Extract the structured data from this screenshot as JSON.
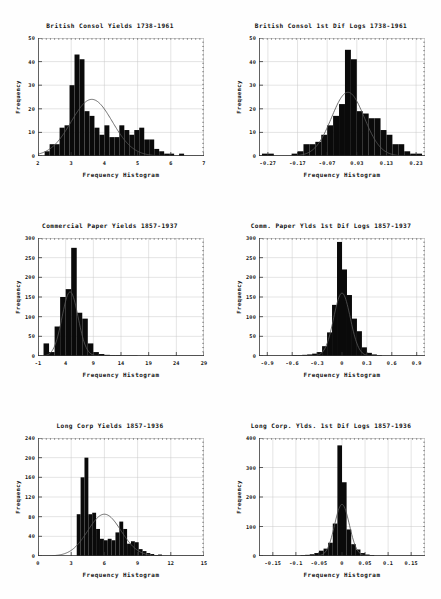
{
  "figure": {
    "name": "frequency-histogram-panel-grid",
    "rows": 3,
    "cols": 2,
    "bar_color": "#0a0a0a",
    "curve_color": "#555555",
    "grid_color": "#c9c9c9"
  },
  "chart_data": [
    {
      "id": "british-consol-yields",
      "type": "bar",
      "title": "British Consol Yields 1738-1961",
      "xlabel": "Frequency Histogram",
      "ylabel": "Frequency",
      "xlim": [
        2,
        7
      ],
      "ylim": [
        0,
        50
      ],
      "xticks": [
        2,
        3,
        4,
        5,
        6,
        7
      ],
      "xticklabels": [
        "2",
        "3",
        "4",
        "5",
        "6",
        "7"
      ],
      "yticks": [
        0,
        10,
        20,
        30,
        40,
        50
      ],
      "yticklabels": [
        "0",
        "10",
        "20",
        "30",
        "40",
        "50"
      ],
      "grid": true,
      "legend": "none",
      "bin_edges": [
        2.2,
        2.35,
        2.5,
        2.65,
        2.8,
        2.95,
        3.1,
        3.25,
        3.4,
        3.55,
        3.7,
        3.85,
        4.0,
        4.15,
        4.3,
        4.45,
        4.6,
        4.75,
        4.9,
        5.05,
        5.2,
        5.35,
        5.5,
        5.65,
        5.8,
        5.95,
        6.1,
        6.25,
        6.4
      ],
      "values": [
        2,
        5,
        5,
        12,
        13,
        30,
        43,
        41,
        19,
        17,
        12,
        9,
        13,
        8,
        8,
        13,
        11,
        9,
        11,
        12,
        7,
        7,
        3,
        2,
        1,
        1,
        0,
        1
      ],
      "curve": {
        "type": "normal-fit",
        "peak": 24,
        "mean": 3.62,
        "sd": 0.62
      }
    },
    {
      "id": "british-consol-1st-dif-logs",
      "type": "bar",
      "title": "British Consol 1st Dif Logs 1738-1961",
      "xlabel": "Frequency Histogram",
      "ylabel": "Frequency",
      "xlim": [
        -0.3,
        0.26
      ],
      "ylim": [
        0,
        50
      ],
      "xticks": [
        -0.27,
        -0.17,
        -0.07,
        0.03,
        0.13,
        0.23
      ],
      "xticklabels": [
        "-0.27",
        "-0.17",
        "-0.07",
        "0.03",
        "0.13",
        "0.23"
      ],
      "yticks": [
        0,
        10,
        20,
        30,
        40,
        50
      ],
      "yticklabels": [
        "0",
        "10",
        "20",
        "30",
        "40",
        "50"
      ],
      "grid": true,
      "legend": "none",
      "bin_edges": [
        -0.29,
        -0.27,
        -0.25,
        -0.23,
        -0.21,
        -0.19,
        -0.17,
        -0.15,
        -0.13,
        -0.11,
        -0.09,
        -0.07,
        -0.05,
        -0.03,
        -0.01,
        0.01,
        0.03,
        0.05,
        0.07,
        0.09,
        0.11,
        0.13,
        0.15,
        0.17,
        0.19,
        0.21,
        0.23,
        0.25
      ],
      "values": [
        1,
        1,
        0,
        0,
        0,
        1,
        2,
        5,
        5,
        6,
        9,
        13,
        17,
        22,
        45,
        41,
        19,
        18,
        16,
        16,
        11,
        9,
        5,
        5,
        2,
        1,
        1
      ],
      "curve": {
        "type": "normal-fit",
        "peak": 27,
        "mean": 0.0,
        "sd": 0.055
      }
    },
    {
      "id": "commercial-paper-yields",
      "type": "bar",
      "title": "Commercial Paper Yields 1857-1937",
      "xlabel": "Frequency Histogram",
      "ylabel": "Frequency",
      "xlim": [
        -1,
        29
      ],
      "ylim": [
        0,
        300
      ],
      "xticks": [
        -1,
        4,
        9,
        14,
        19,
        24,
        29
      ],
      "xticklabels": [
        "-1",
        "4",
        "9",
        "14",
        "19",
        "24",
        "29"
      ],
      "yticks": [
        0,
        50,
        100,
        150,
        200,
        250,
        300
      ],
      "yticklabels": [
        "0",
        "50",
        "100",
        "150",
        "200",
        "250",
        "300"
      ],
      "grid": true,
      "legend": "none",
      "bin_edges": [
        0,
        1,
        2,
        3,
        4,
        5,
        6,
        7,
        8,
        9,
        10,
        11,
        12,
        13,
        14,
        15,
        16,
        17,
        18,
        19,
        20
      ],
      "values": [
        32,
        10,
        75,
        150,
        170,
        275,
        110,
        95,
        32,
        10,
        5,
        3,
        2,
        2,
        1,
        1,
        1,
        0,
        0,
        0
      ],
      "curve": {
        "type": "normal-fit",
        "peak": 163,
        "mean": 4.8,
        "sd": 1.45
      }
    },
    {
      "id": "comm-paper-ylds-1st-dif-logs",
      "type": "bar",
      "title": "Comm. Paper Ylds 1st Dif Logs 1857-1937",
      "xlabel": "Frequency Histogram",
      "ylabel": "Frequency",
      "xlim": [
        -1.0,
        1.0
      ],
      "ylim": [
        0,
        300
      ],
      "xticks": [
        -0.9,
        -0.6,
        -0.3,
        0,
        0.3,
        0.6,
        0.9
      ],
      "xticklabels": [
        "-0.9",
        "-0.6",
        "-0.3",
        "0",
        "0.3",
        "0.6",
        "0.9"
      ],
      "yticks": [
        0,
        50,
        100,
        150,
        200,
        250,
        300
      ],
      "yticklabels": [
        "0",
        "50",
        "100",
        "150",
        "200",
        "250",
        "300"
      ],
      "grid": true,
      "legend": "none",
      "bin_edges": [
        -0.6,
        -0.54,
        -0.48,
        -0.42,
        -0.36,
        -0.3,
        -0.24,
        -0.18,
        -0.12,
        -0.06,
        0,
        0.06,
        0.12,
        0.18,
        0.24,
        0.3,
        0.36,
        0.42,
        0.48
      ],
      "values": [
        2,
        2,
        3,
        4,
        6,
        10,
        25,
        60,
        130,
        290,
        220,
        155,
        95,
        63,
        22,
        8,
        4,
        2
      ],
      "curve": {
        "type": "normal-fit",
        "peak": 160,
        "mean": 0.0,
        "sd": 0.1
      }
    },
    {
      "id": "long-corp-yields",
      "type": "bar",
      "title": "Long Corp Yields 1857-1936",
      "xlabel": "Frequency Histogram",
      "ylabel": "Frequency",
      "xlim": [
        0,
        15
      ],
      "ylim": [
        0,
        240
      ],
      "xticks": [
        0,
        3,
        6,
        9,
        12,
        15
      ],
      "xticklabels": [
        "0",
        "3",
        "6",
        "9",
        "12",
        "15"
      ],
      "yticks": [
        0,
        40,
        80,
        120,
        160,
        200,
        240
      ],
      "yticklabels": [
        "0",
        "40",
        "80",
        "120",
        "160",
        "200",
        "240"
      ],
      "grid": true,
      "legend": "none",
      "bin_edges": [
        3.5,
        3.85,
        4.2,
        4.55,
        4.9,
        5.25,
        5.6,
        5.95,
        6.3,
        6.65,
        7.0,
        7.35,
        7.7,
        8.05,
        8.4,
        8.75,
        9.1,
        9.45,
        9.8,
        10.15,
        10.5,
        10.85,
        11.2
      ],
      "values": [
        85,
        160,
        200,
        85,
        88,
        55,
        35,
        32,
        35,
        32,
        48,
        70,
        55,
        25,
        30,
        28,
        14,
        10,
        6,
        4,
        2,
        3
      ],
      "curve": {
        "type": "normal-fit",
        "peak": 85,
        "mean": 6.0,
        "sd": 1.5
      }
    },
    {
      "id": "long-corp-ylds-1st-dif-logs",
      "type": "bar",
      "title": "Long Corp. Ylds. 1st Dif Logs 1857-1936",
      "xlabel": "Frequency Histogram",
      "ylabel": "Frequency",
      "xlim": [
        -0.18,
        0.18
      ],
      "ylim": [
        0,
        400
      ],
      "xticks": [
        -0.15,
        -0.1,
        -0.05,
        0,
        0.05,
        0.1,
        0.15
      ],
      "xticklabels": [
        "-0.15",
        "-0.1",
        "-0.05",
        "0",
        "0.05",
        "0.1",
        "0.15"
      ],
      "yticks": [
        0,
        100,
        200,
        300,
        400
      ],
      "yticklabels": [
        "0",
        "100",
        "200",
        "300",
        "400"
      ],
      "grid": true,
      "legend": "none",
      "bin_edges": [
        -0.09,
        -0.08,
        -0.07,
        -0.06,
        -0.05,
        -0.04,
        -0.03,
        -0.02,
        -0.01,
        0,
        0.01,
        0.02,
        0.03,
        0.04,
        0.05,
        0.06,
        0.07
      ],
      "values": [
        3,
        4,
        6,
        10,
        18,
        25,
        45,
        110,
        375,
        250,
        90,
        40,
        22,
        10,
        5,
        3
      ],
      "curve": {
        "type": "normal-fit",
        "peak": 175,
        "mean": 0.0,
        "sd": 0.016
      }
    }
  ]
}
